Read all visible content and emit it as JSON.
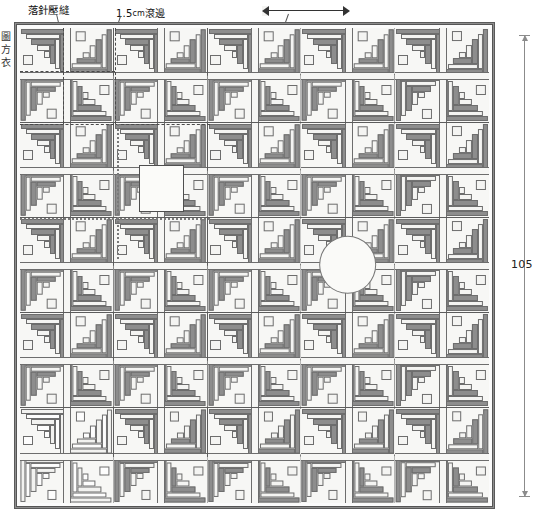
{
  "diagram": {
    "type": "quilt-construction-layout",
    "title_labels": {
      "drop_needle_seam": "落針壓縫",
      "binding": "1.5cm滾邊",
      "binding_value": "1.5",
      "binding_unit": "cm",
      "binding_word": "滾邊",
      "side_note_chars": [
        "圖",
        "方",
        "衣"
      ]
    },
    "dimensions": {
      "height_label": "105",
      "top_arrow_label": ""
    },
    "grid": {
      "columns": 5,
      "rows": 5,
      "quarters_per_block": 4,
      "logs_per_quarter": 5
    },
    "colors": {
      "dark_fabric": "#8d8d8d",
      "light_fabric": "#f4f4f2",
      "binding": "#8d8d8d",
      "seam_line": "#6d6d6d",
      "grid_line": "#5c5c5c",
      "stitch_line": "#4a4a4a",
      "background": "#ffffff"
    },
    "special_blocks": [
      {
        "name": "circle-motif-block",
        "row": 3,
        "col": 4,
        "feature": "white circle appliqué"
      },
      {
        "name": "light-block",
        "row": 5,
        "col": 1,
        "feature": "light / reversed colourway"
      },
      {
        "name": "inset-patch",
        "row": 2,
        "col": 2,
        "feature": "small light quarter patch"
      }
    ]
  }
}
